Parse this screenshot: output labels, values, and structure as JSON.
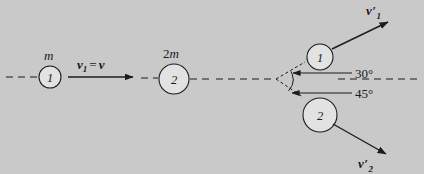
{
  "figure": {
    "background_color": "#c9c9c9",
    "ink_color": "#1c1c1c",
    "width": 424,
    "height": 174
  },
  "before": {
    "axis_label": "dashed-horizontal-axis",
    "body1": {
      "circle_number": "1",
      "mass_label_prefix": "",
      "mass_label_symbol": "m",
      "cx": 50,
      "cy": 77,
      "r": 11
    },
    "body2": {
      "circle_number": "2",
      "mass_label_prefix": "2",
      "mass_label_symbol": "m",
      "cx": 174,
      "cy": 79,
      "r": 15
    },
    "velocity_vector": {
      "symbol": "v",
      "subscript": "1",
      "equals": "=",
      "value_symbol": "v",
      "full_text": "v1 = v",
      "x1": 68,
      "y1": 77,
      "x2": 140,
      "y2": 77
    }
  },
  "after": {
    "axis_label": "dashed-horizontal-axis",
    "body1": {
      "circle_number": "1",
      "cx": 320,
      "cy": 57,
      "r": 13
    },
    "body2": {
      "circle_number": "2",
      "cx": 320,
      "cy": 115,
      "r": 17
    },
    "velocity1": {
      "symbol": "v",
      "prime": "′",
      "subscript": "1",
      "angle_deg": 30,
      "direction": "above-axis-right"
    },
    "velocity2": {
      "symbol": "v",
      "prime": "′",
      "subscript": "2",
      "angle_deg": 45,
      "direction": "below-axis-right"
    },
    "angles": [
      {
        "value": "30°",
        "name": "angle-30-label"
      },
      {
        "value": "45°",
        "name": "angle-45-label"
      }
    ],
    "angle_30": "30°",
    "angle_45": "45°"
  }
}
